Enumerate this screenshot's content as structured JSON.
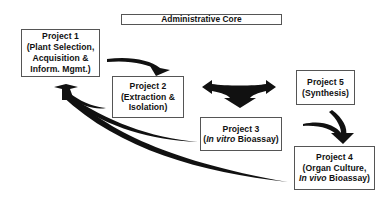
{
  "diagram": {
    "type": "flow-diagram",
    "colors": {
      "box_border": "#555555",
      "text": "#111111",
      "arrow": "#111111",
      "background": "#ffffff"
    },
    "admin_core": {
      "label": "Administrative Core"
    },
    "projects": [
      {
        "id": "p1",
        "title": "Project 1",
        "lines": [
          "(Plant Selection,",
          "Acquisition &",
          "Inform. Mgmt.)"
        ]
      },
      {
        "id": "p2",
        "title": "Project 2",
        "lines": [
          "(Extraction &",
          "Isolation)"
        ]
      },
      {
        "id": "p3",
        "title": "Project 3",
        "lines_rich": {
          "open": "(",
          "italic": "In vitro",
          "rest": " Bioassay)"
        }
      },
      {
        "id": "p4",
        "title": "Project 4",
        "lines": [
          "(Organ Culture,"
        ],
        "lines_rich": {
          "italic": "In vivo",
          "rest": " Bioassay)"
        }
      },
      {
        "id": "p5",
        "title": "Project 5",
        "lines": [
          "(Synthesis)"
        ]
      }
    ],
    "arrows": [
      {
        "from": "Project 1",
        "to": "Project 2",
        "shape": "curved"
      },
      {
        "from": "Project 2",
        "to": [
          "Project 3",
          "Project 5"
        ],
        "shape": "three-way",
        "note": "bidirectional left-right with downward head to Project 3"
      },
      {
        "from": "Project 5",
        "to": "Project 4",
        "shape": "curved"
      },
      {
        "from": "Project 3",
        "to": "Project 4",
        "shape": "curved-merge"
      },
      {
        "from": [
          "Project 2",
          "Project 3",
          "Project 4"
        ],
        "to": "Project 1",
        "shape": "converging-curved"
      }
    ]
  }
}
